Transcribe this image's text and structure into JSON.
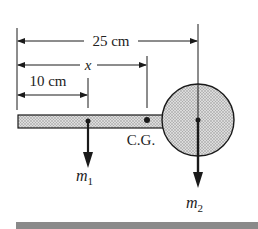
{
  "diagram": {
    "dimensions": {
      "total": "25 cm",
      "cg": "x",
      "m1_distance": "10 cm"
    },
    "labels": {
      "cg": "C.G.",
      "m1_base": "m",
      "m1_sub": "1",
      "m2_base": "m",
      "m2_sub": "2"
    },
    "colors": {
      "ink": "#1a1a1a",
      "fill": "#c8c8c8",
      "bottom_bar": "#8a8a8a"
    }
  }
}
